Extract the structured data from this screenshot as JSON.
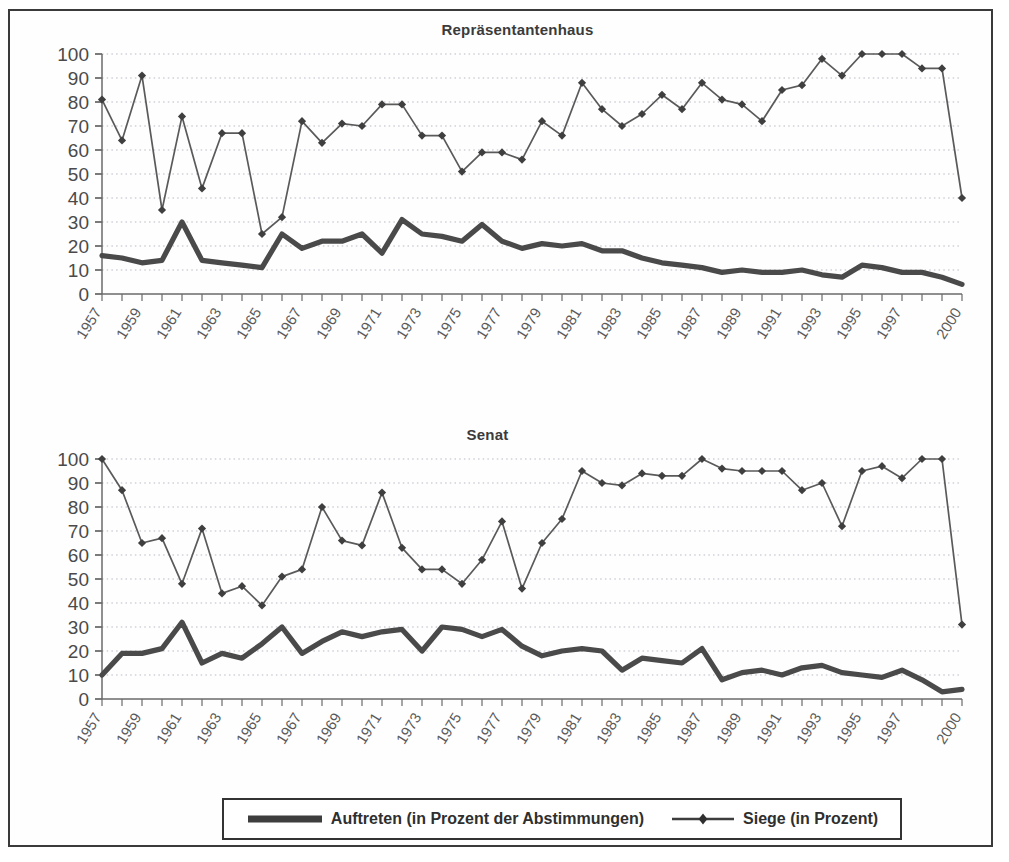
{
  "figure": {
    "background_color": "#ffffff",
    "line_color": "#4a4a4a",
    "frame_color": "#3a3a3a"
  },
  "legend": {
    "items": [
      {
        "label": "Auftreten (in Prozent der Abstimmungen)",
        "marker": "thick-line",
        "color": "#3d3d3d"
      },
      {
        "label": "Siege (in Prozent)",
        "marker": "line-with-diamond",
        "color": "#4a4a4a"
      }
    ]
  },
  "axis": {
    "y_ticks": [
      "0",
      "10",
      "20",
      "30",
      "40",
      "50",
      "60",
      "70",
      "80",
      "90",
      "100"
    ],
    "x_tick_labels": [
      "1957",
      "1959",
      "1961",
      "1963",
      "1965",
      "1967",
      "1969",
      "1971",
      "1973",
      "1975",
      "1977",
      "1979",
      "1981",
      "1983",
      "1985",
      "1987",
      "1989",
      "1991",
      "1993",
      "1995",
      "1997",
      "2000"
    ]
  },
  "chart_data": [
    {
      "type": "line",
      "title": "Repräsentantenhaus",
      "xlabel": "",
      "ylabel": "",
      "ylim": [
        0,
        100
      ],
      "grid": true,
      "legend_position": "bottom",
      "x": [
        "1957",
        "1958",
        "1959",
        "1960",
        "1961",
        "1962",
        "1963",
        "1964",
        "1965",
        "1966",
        "1967",
        "1968",
        "1969",
        "1970",
        "1971",
        "1972",
        "1973",
        "1974",
        "1975",
        "1976",
        "1977",
        "1978",
        "1979",
        "1980",
        "1981",
        "1982",
        "1983",
        "1984",
        "1985",
        "1986",
        "1987",
        "1988",
        "1989",
        "1990",
        "1991",
        "1992",
        "1993",
        "1994",
        "1995",
        "1996",
        "1997",
        "1998",
        "1999",
        "2000"
      ],
      "series": [
        {
          "name": "Auftreten (in Prozent der Abstimmungen)",
          "values": [
            16,
            15,
            13,
            14,
            30,
            14,
            13,
            12,
            11,
            25,
            19,
            22,
            22,
            25,
            17,
            31,
            25,
            24,
            22,
            29,
            22,
            19,
            21,
            20,
            21,
            18,
            18,
            15,
            13,
            12,
            11,
            9,
            10,
            9,
            9,
            10,
            8,
            7,
            12,
            11,
            9,
            9,
            7,
            4
          ]
        },
        {
          "name": "Siege (in Prozent)",
          "values": [
            81,
            64,
            91,
            35,
            74,
            44,
            67,
            67,
            25,
            32,
            72,
            63,
            71,
            70,
            79,
            79,
            66,
            66,
            51,
            59,
            59,
            56,
            72,
            66,
            88,
            77,
            70,
            75,
            83,
            77,
            88,
            81,
            79,
            72,
            85,
            87,
            98,
            91,
            100,
            100,
            100,
            94,
            94,
            40
          ]
        }
      ]
    },
    {
      "type": "line",
      "title": "Senat",
      "xlabel": "",
      "ylabel": "",
      "ylim": [
        0,
        100
      ],
      "grid": true,
      "legend_position": "bottom",
      "x": [
        "1957",
        "1958",
        "1959",
        "1960",
        "1961",
        "1962",
        "1963",
        "1964",
        "1965",
        "1966",
        "1967",
        "1968",
        "1969",
        "1970",
        "1971",
        "1972",
        "1973",
        "1974",
        "1975",
        "1976",
        "1977",
        "1978",
        "1979",
        "1980",
        "1981",
        "1982",
        "1983",
        "1984",
        "1985",
        "1986",
        "1987",
        "1988",
        "1989",
        "1990",
        "1991",
        "1992",
        "1993",
        "1994",
        "1995",
        "1996",
        "1997",
        "1998",
        "1999",
        "2000"
      ],
      "series": [
        {
          "name": "Auftreten (in Prozent der Abstimmungen)",
          "values": [
            10,
            19,
            19,
            21,
            32,
            15,
            19,
            17,
            23,
            30,
            19,
            24,
            28,
            26,
            28,
            29,
            20,
            30,
            29,
            26,
            29,
            22,
            18,
            20,
            21,
            20,
            12,
            17,
            16,
            15,
            21,
            8,
            11,
            12,
            10,
            13,
            14,
            11,
            10,
            9,
            12,
            8,
            3,
            4
          ]
        },
        {
          "name": "Siege (in Prozent)",
          "values": [
            100,
            87,
            65,
            67,
            48,
            71,
            44,
            47,
            39,
            51,
            54,
            80,
            66,
            64,
            86,
            63,
            54,
            54,
            48,
            58,
            74,
            46,
            65,
            75,
            95,
            90,
            89,
            94,
            93,
            93,
            100,
            96,
            95,
            95,
            95,
            87,
            90,
            72,
            95,
            97,
            92,
            100,
            100,
            31
          ]
        }
      ]
    }
  ]
}
